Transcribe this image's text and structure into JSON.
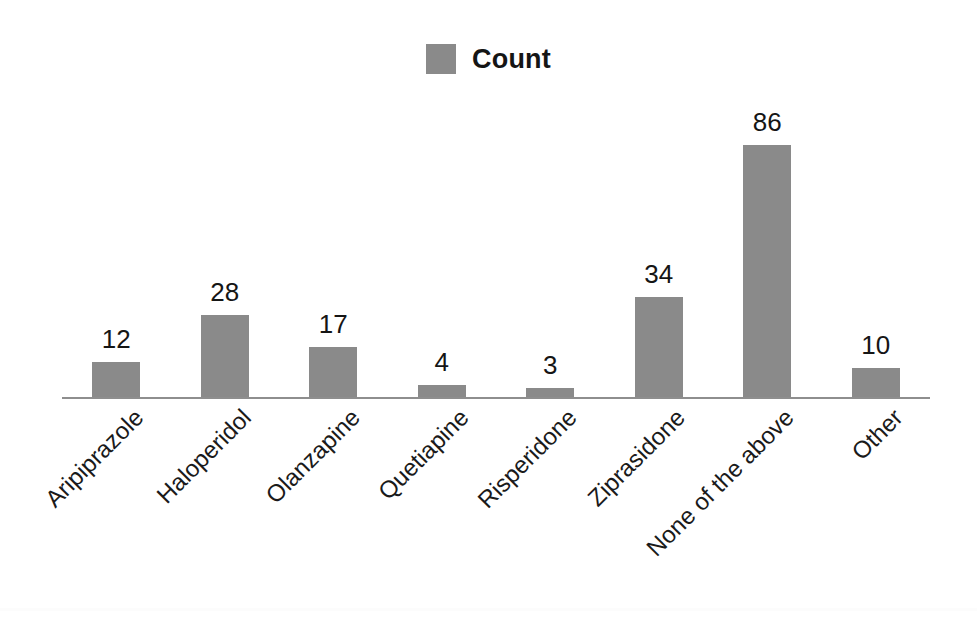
{
  "legend": {
    "label": "Count",
    "swatch_color": "#8a8a8a",
    "position": "top-center"
  },
  "colors": {
    "bar": "#8a8a8a",
    "axis": "#8e8e8e",
    "text": "#151515",
    "background": "#ffffff"
  },
  "chart_data": {
    "type": "bar",
    "title": "",
    "subtitle": "",
    "xlabel": "",
    "ylabel": "",
    "categories": [
      "Aripiprazole",
      "Haloperidol",
      "Olanzapine",
      "Quetiapine",
      "Risperidone",
      "Ziprasidone",
      "None of the above",
      "Other"
    ],
    "values": [
      12,
      28,
      17,
      4,
      3,
      34,
      86,
      10
    ],
    "series": [
      {
        "name": "Count",
        "values": [
          12,
          28,
          17,
          4,
          3,
          34,
          86,
          10
        ]
      }
    ],
    "data_labels": [
      "12",
      "28",
      "17",
      "4",
      "3",
      "34",
      "86",
      "10"
    ],
    "ylim": [
      0,
      98
    ],
    "grid": false,
    "y_axis_visible": false,
    "x_axis_visible": true,
    "tick_labels_rotation": -45,
    "legend": {
      "entries": [
        "Count"
      ],
      "position": "top-center"
    }
  }
}
